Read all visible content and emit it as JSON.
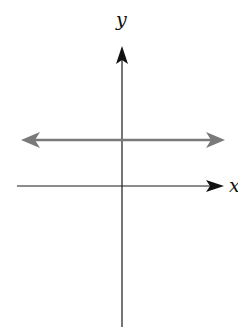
{
  "diagram": {
    "type": "coordinate-plane",
    "axes": {
      "x_label": "x",
      "y_label": "y",
      "axis_color": "#1a1a1a"
    },
    "line": {
      "orientation": "horizontal",
      "position": "above x-axis",
      "arrows": "both ends",
      "color": "#7a7a7a"
    }
  }
}
